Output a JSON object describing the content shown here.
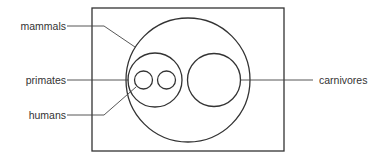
{
  "diagram": {
    "type": "nested-set (Euler) diagram",
    "labels": {
      "mammals": "mammals",
      "primates": "primates",
      "humans": "humans",
      "carnivores": "carnivores"
    },
    "sets": [
      {
        "id": "universe",
        "shape": "rectangle"
      },
      {
        "id": "mammals",
        "shape": "circle",
        "parent": "universe"
      },
      {
        "id": "primates",
        "shape": "circle",
        "parent": "mammals"
      },
      {
        "id": "humans",
        "shape": "circle",
        "parent": "primates"
      },
      {
        "id": "other-primate",
        "shape": "circle",
        "parent": "primates"
      },
      {
        "id": "carnivores",
        "shape": "circle",
        "parent": "mammals"
      }
    ],
    "colors": {
      "stroke": "#333333",
      "text": "#333333",
      "background": "#ffffff"
    }
  }
}
